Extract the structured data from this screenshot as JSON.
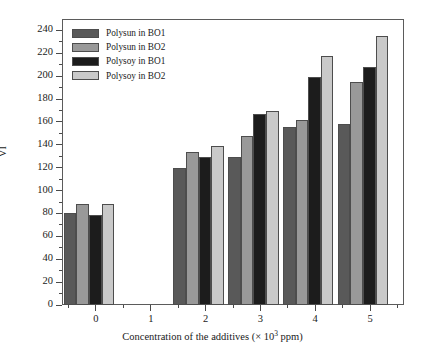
{
  "chart_data": {
    "type": "bar",
    "title": "",
    "xlabel": "Concentration of the additives (× 10³ ppm)",
    "xlabel_prefix": "Concentration of the additives (× 10",
    "xlabel_superscript": "3",
    "xlabel_suffix": " ppm)",
    "ylabel": "VI",
    "categories": [
      "0",
      "1",
      "2",
      "3",
      "4",
      "5"
    ],
    "x": [
      0,
      1,
      2,
      3,
      4,
      5
    ],
    "xlim": [
      -0.62,
      5.62
    ],
    "ylim": [
      0,
      250
    ],
    "ytick_labels": [
      "0",
      "20",
      "40",
      "60",
      "80",
      "100",
      "120",
      "140",
      "160",
      "180",
      "200",
      "220",
      "240"
    ],
    "yticks": [
      0,
      20,
      40,
      60,
      80,
      100,
      120,
      140,
      160,
      180,
      200,
      220,
      240
    ],
    "yminor_step": 10,
    "xtick_labels": [
      "0",
      "1",
      "2",
      "3",
      "4",
      "5"
    ],
    "grid": false,
    "legend_position": "upper-left",
    "series": [
      {
        "name": "Polysun in BO1",
        "color": "#595959",
        "values": [
          80,
          null,
          120,
          129,
          156,
          158
        ]
      },
      {
        "name": "Polysun in BO2",
        "color": "#999999",
        "values": [
          88,
          null,
          134,
          148,
          162,
          195
        ]
      },
      {
        "name": "Polysoy in BO1",
        "color": "#1c1c1c",
        "values": [
          79,
          null,
          129,
          167,
          199,
          208
        ]
      },
      {
        "name": "Polysoy in BO2",
        "color": "#c9c9c9",
        "values": [
          88,
          null,
          139,
          170,
          218,
          235
        ]
      }
    ]
  },
  "legend": {
    "items": [
      {
        "label": "Polysun in BO1",
        "color": "#595959"
      },
      {
        "label": "Polysun in BO2",
        "color": "#999999"
      },
      {
        "label": "Polysoy in BO1",
        "color": "#1c1c1c"
      },
      {
        "label": "Polysoy in BO2",
        "color": "#c9c9c9"
      }
    ]
  },
  "axes": {
    "y_label": "VI",
    "x_label_full": "Concentration of the additives (× 10³ ppm)"
  },
  "colors": {
    "frame": "#5b5b5b",
    "text": "#1a1a1a",
    "background": "#ffffff",
    "bar_edge": "#4d4d4d"
  }
}
